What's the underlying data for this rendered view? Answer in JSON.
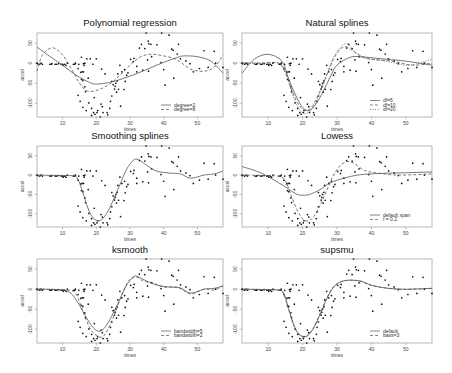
{
  "figure": {
    "width": 452,
    "height": 373,
    "rows": 3,
    "cols": 2
  },
  "chart_data": [
    {
      "type": "scatter",
      "title": "Polynomial regression",
      "xlabel": "times",
      "ylabel": "accel",
      "xlim": [
        2.4,
        57.6
      ],
      "ylim": [
        -134,
        75
      ],
      "xticks": [
        10,
        20,
        30,
        40,
        50
      ],
      "yticks": [
        50,
        0,
        -50,
        -100
      ],
      "legend": {
        "position": "bottomright",
        "entries": [
          {
            "label": "degree=2",
            "style": "solid"
          },
          {
            "label": "degree=8",
            "style": "dashed"
          }
        ]
      },
      "series": [
        {
          "name": "degree=2",
          "style": "solid",
          "x": [
            2.4,
            6,
            10,
            14,
            18,
            20,
            24,
            28,
            32,
            36,
            40,
            44,
            46,
            50,
            54,
            57.6
          ],
          "y": [
            40,
            18,
            -5,
            -30,
            -48,
            -52,
            -48,
            -38,
            -26,
            -12,
            2,
            14,
            18,
            16,
            5,
            -25
          ]
        },
        {
          "name": "degree=8",
          "style": "dashed",
          "x": [
            2.4,
            4,
            7,
            10,
            13,
            15,
            17,
            19,
            21,
            24,
            27,
            30,
            33,
            36,
            40,
            44,
            48,
            52,
            55,
            57.6
          ],
          "y": [
            -20,
            20,
            38,
            20,
            -20,
            -50,
            -68,
            -70,
            -65,
            -52,
            -30,
            -5,
            15,
            22,
            18,
            8,
            -15,
            -20,
            -10,
            20
          ]
        }
      ]
    },
    {
      "type": "scatter",
      "title": "Natural splines",
      "xlabel": "times",
      "ylabel": "accel",
      "xlim": [
        2.4,
        57.6
      ],
      "ylim": [
        -134,
        75
      ],
      "xticks": [
        10,
        20,
        30,
        40,
        50
      ],
      "yticks": [
        50,
        0,
        -50,
        -100
      ],
      "legend": {
        "position": "bottomright",
        "entries": [
          {
            "label": "df=5",
            "style": "solid"
          },
          {
            "label": "df=10",
            "style": "dashed"
          },
          {
            "label": "df=20",
            "style": "dotted"
          }
        ]
      },
      "series": [
        {
          "name": "df=5",
          "style": "solid",
          "x": [
            2.4,
            6,
            10,
            14,
            16,
            18,
            20,
            22,
            24,
            26,
            28,
            30,
            34,
            38,
            44,
            50,
            57.6
          ],
          "y": [
            -25,
            10,
            22,
            5,
            -40,
            -80,
            -110,
            -118,
            -100,
            -70,
            -35,
            -5,
            15,
            15,
            10,
            5,
            -5
          ]
        },
        {
          "name": "df=10",
          "style": "dashed",
          "x": [
            2.4,
            8,
            13,
            15,
            17,
            19,
            21,
            23,
            25,
            27,
            29,
            31,
            33,
            36,
            40,
            46,
            52,
            57.6
          ],
          "y": [
            0,
            0,
            0,
            -25,
            -70,
            -105,
            -118,
            -105,
            -70,
            -30,
            10,
            35,
            40,
            22,
            10,
            5,
            -5,
            0
          ]
        },
        {
          "name": "df=20",
          "style": "dotted",
          "x": [
            2.4,
            8,
            13,
            15,
            17,
            19,
            21,
            23,
            25,
            27,
            29,
            31,
            33,
            35,
            38,
            42,
            46,
            50,
            54,
            57.6
          ],
          "y": [
            0,
            0,
            0,
            -20,
            -75,
            -115,
            -125,
            -110,
            -75,
            -30,
            15,
            40,
            48,
            30,
            12,
            8,
            2,
            -5,
            0,
            10
          ]
        }
      ]
    },
    {
      "type": "scatter",
      "title": "Smoothing splines",
      "xlabel": "times",
      "ylabel": "accel",
      "xlim": [
        2.4,
        57.6
      ],
      "ylim": [
        -134,
        75
      ],
      "xticks": [
        10,
        20,
        30,
        40,
        50
      ],
      "yticks": [
        50,
        0,
        -50,
        -100
      ],
      "legend": null,
      "series": [
        {
          "name": "smooth.spline",
          "style": "solid",
          "x": [
            2.4,
            8,
            13,
            14.5,
            16,
            17.5,
            19,
            21,
            23,
            25,
            27,
            29,
            31,
            32.5,
            35,
            38,
            42,
            45,
            48,
            52,
            55,
            57.6
          ],
          "y": [
            0,
            -1,
            -2,
            -10,
            -45,
            -85,
            -110,
            -118,
            -100,
            -65,
            -25,
            15,
            38,
            40,
            25,
            10,
            5,
            3,
            -8,
            0,
            3,
            10
          ]
        }
      ]
    },
    {
      "type": "scatter",
      "title": "Lowess",
      "xlabel": "times",
      "ylabel": "accel",
      "xlim": [
        2.4,
        57.6
      ],
      "ylim": [
        -134,
        75
      ],
      "xticks": [
        10,
        20,
        30,
        40,
        50
      ],
      "yticks": [
        50,
        0,
        -50,
        -100
      ],
      "legend": {
        "position": "bottomright",
        "entries": [
          {
            "label": "default span",
            "style": "solid"
          },
          {
            "label": "f = 0.2",
            "style": "dashed"
          }
        ]
      },
      "series": [
        {
          "name": "default span",
          "style": "solid",
          "x": [
            2.4,
            8,
            14,
            18,
            20,
            22,
            25,
            28,
            32,
            36,
            40,
            45,
            50,
            57.6
          ],
          "y": [
            22,
            5,
            -25,
            -48,
            -52,
            -50,
            -38,
            -20,
            -8,
            0,
            3,
            5,
            6,
            8
          ]
        },
        {
          "name": "f = 0.2",
          "style": "dashed",
          "x": [
            2.4,
            8,
            13,
            15,
            17,
            19,
            21,
            23,
            25,
            27,
            29,
            31,
            33,
            35,
            38,
            42,
            48,
            57.6
          ],
          "y": [
            0,
            -1,
            -3,
            -15,
            -60,
            -100,
            -118,
            -110,
            -80,
            -40,
            0,
            25,
            35,
            30,
            12,
            5,
            0,
            3
          ]
        }
      ]
    },
    {
      "type": "scatter",
      "title": "ksmooth",
      "xlabel": "times",
      "ylabel": "accel",
      "xlim": [
        2.4,
        57.6
      ],
      "ylim": [
        -134,
        75
      ],
      "xticks": [
        10,
        20,
        30,
        40,
        50
      ],
      "yticks": [
        50,
        0,
        -50,
        -100
      ],
      "legend": {
        "position": "bottomright",
        "entries": [
          {
            "label": "bandwidth=5",
            "style": "solid"
          },
          {
            "label": "bandwidth=2",
            "style": "dashed"
          }
        ]
      },
      "series": [
        {
          "name": "bandwidth=5",
          "style": "solid",
          "x": [
            2.4,
            8,
            11,
            13,
            15,
            17,
            19,
            21,
            23,
            25,
            27,
            29,
            31,
            32,
            35,
            38,
            42,
            45,
            48,
            52,
            55,
            57.6
          ],
          "y": [
            0,
            -1,
            -4,
            -15,
            -40,
            -70,
            -95,
            -105,
            -90,
            -60,
            -25,
            10,
            30,
            32,
            20,
            10,
            5,
            3,
            -10,
            0,
            2,
            8
          ]
        },
        {
          "name": "bandwidth=2",
          "style": "dashed",
          "x": [
            2.4,
            8,
            12,
            14,
            16,
            18,
            20,
            22,
            24,
            26,
            28,
            30,
            32,
            34,
            37,
            40,
            44,
            48,
            52,
            55,
            57.6
          ],
          "y": [
            0,
            -1,
            -3,
            -12,
            -55,
            -95,
            -115,
            -118,
            -90,
            -50,
            -5,
            25,
            30,
            20,
            15,
            5,
            5,
            -12,
            0,
            -2,
            8
          ]
        }
      ]
    },
    {
      "type": "scatter",
      "title": "supsmu",
      "xlabel": "times",
      "ylabel": "accel",
      "xlim": [
        2.4,
        57.6
      ],
      "ylim": [
        -134,
        75
      ],
      "xticks": [
        10,
        20,
        30,
        40,
        50
      ],
      "yticks": [
        50,
        0,
        -50,
        -100
      ],
      "legend": {
        "position": "bottomright",
        "entries": [
          {
            "label": "default",
            "style": "solid"
          },
          {
            "label": "bass=3",
            "style": "dashed"
          }
        ]
      },
      "series": [
        {
          "name": "default",
          "style": "solid",
          "x": [
            2.4,
            8,
            13,
            14.5,
            16,
            17.5,
            19,
            21,
            23,
            25,
            27,
            29,
            31,
            33,
            35,
            37,
            40,
            44,
            48,
            52,
            57.6
          ],
          "y": [
            0,
            -1,
            -2,
            -10,
            -50,
            -90,
            -112,
            -118,
            -100,
            -65,
            -25,
            5,
            18,
            22,
            22,
            20,
            10,
            3,
            0,
            0,
            2
          ]
        },
        {
          "name": "bass=3",
          "style": "dashed",
          "x": [
            2.4,
            8,
            13,
            14.5,
            16,
            17.5,
            19,
            21,
            23,
            25,
            27,
            29,
            31,
            33,
            35,
            37,
            40,
            44,
            48,
            52,
            57.6
          ],
          "y": [
            0,
            -1,
            -3,
            -12,
            -52,
            -92,
            -114,
            -118,
            -98,
            -62,
            -22,
            6,
            18,
            22,
            22,
            19,
            9,
            3,
            0,
            0,
            2
          ]
        }
      ]
    }
  ],
  "points": {
    "x": [
      2.4,
      2.6,
      3.2,
      3.6,
      4,
      6.2,
      6.6,
      6.8,
      7.8,
      8.2,
      8.8,
      9.6,
      10,
      10.2,
      10.6,
      11,
      11.4,
      13.2,
      13.6,
      13.8,
      14.6,
      14.8,
      15.4,
      15.6,
      15.8,
      16,
      16.2,
      16.4,
      16.6,
      16.8,
      17.6,
      17.8,
      18.6,
      19.2,
      19.4,
      19.6,
      20.2,
      20.4,
      21.2,
      21.4,
      21.8,
      22,
      23.2,
      23.4,
      24,
      24.2,
      24.6,
      25,
      25.4,
      25.6,
      26,
      26.2,
      26.4,
      27,
      27.2,
      27.6,
      28.2,
      28.4,
      28.6,
      29.4,
      30.2,
      31,
      31.2,
      32,
      32.8,
      33.4,
      33.8,
      34.4,
      34.8,
      35.2,
      35.4,
      35.6,
      36.2,
      36.4,
      38,
      39.2,
      39.4,
      40,
      40.4,
      41.6,
      42.4,
      42.8,
      43,
      44,
      44.4,
      45,
      46.6,
      47.8,
      48.8,
      50.6,
      52,
      53.2,
      55,
      55.4,
      57.6,
      15.6,
      16.2,
      16.6,
      17.2,
      18.2,
      19,
      20,
      21.6,
      22.6,
      24.6,
      26.6,
      14.6,
      15.2,
      16,
      17,
      18.6,
      25.8,
      29,
      32,
      35.5
    ],
    "y": [
      0,
      -1.3,
      -2.7,
      0,
      -2.7,
      -2.7,
      -2.7,
      -1.3,
      -2.7,
      -2.7,
      -1.3,
      -2.7,
      -2.7,
      -5.4,
      -2.7,
      -5.4,
      0,
      -2.7,
      -2.7,
      0,
      -13.3,
      -2.7,
      -22.8,
      -40.2,
      -21.5,
      -42.9,
      -21.5,
      -5.4,
      -59,
      -71,
      -37.5,
      -99.1,
      -112.5,
      -123.1,
      -85.6,
      -127.2,
      -123.1,
      -117.9,
      -134,
      -101.9,
      -108.4,
      -123.1,
      -123.1,
      -128.5,
      -112.5,
      -95.1,
      -81.8,
      -53.5,
      -64.4,
      -57.6,
      -72.3,
      -44.3,
      -26.8,
      -5.4,
      -107.1,
      -21.5,
      -65.6,
      -16,
      -45.6,
      -24.2,
      9.5,
      4,
      12,
      -21.5,
      37.5,
      46.9,
      -17.4,
      36.2,
      75,
      8.1,
      54.9,
      48.2,
      46.9,
      16,
      45.6,
      1.3,
      75,
      -16,
      -54.9,
      69.6,
      34.8,
      32.1,
      -37.5,
      22.8,
      46.9,
      10.7,
      5.4,
      -1.3,
      -21.5,
      -13.3,
      30.8,
      -10.7,
      29.4,
      0,
      -10.7,
      14.7,
      -1.3,
      0,
      10.7,
      10.7,
      -2.7,
      10.7,
      -14.7,
      -26.8,
      -45,
      -65,
      -80,
      -95,
      -110,
      -118,
      -130,
      -50,
      -30,
      -8,
      -20,
      -30,
      -60,
      -75,
      -40,
      25,
      48,
      62
    ],
    "color": "#111111"
  },
  "colors": {
    "curve": "#555555",
    "axis": "#888888",
    "background": "#ffffff"
  }
}
